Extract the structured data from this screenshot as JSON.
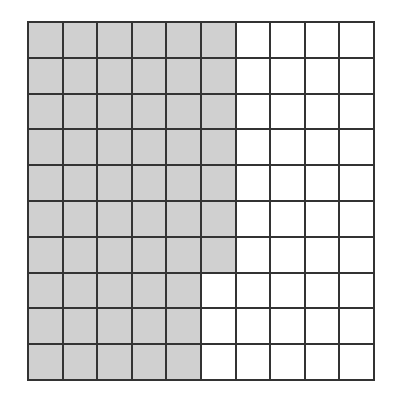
{
  "diagram": {
    "type": "hundred-grid",
    "rows": 10,
    "cols": 10,
    "shaded_count": 57,
    "shaded_pattern": "columns 1-5 fully shaded, column 6 shaded in top 7 rows",
    "column_shaded_rows": [
      10,
      10,
      10,
      10,
      10,
      7,
      0,
      0,
      0,
      0
    ],
    "colors": {
      "shaded": "#d0d0d0",
      "unshaded": "#ffffff",
      "line": "#333333"
    }
  }
}
